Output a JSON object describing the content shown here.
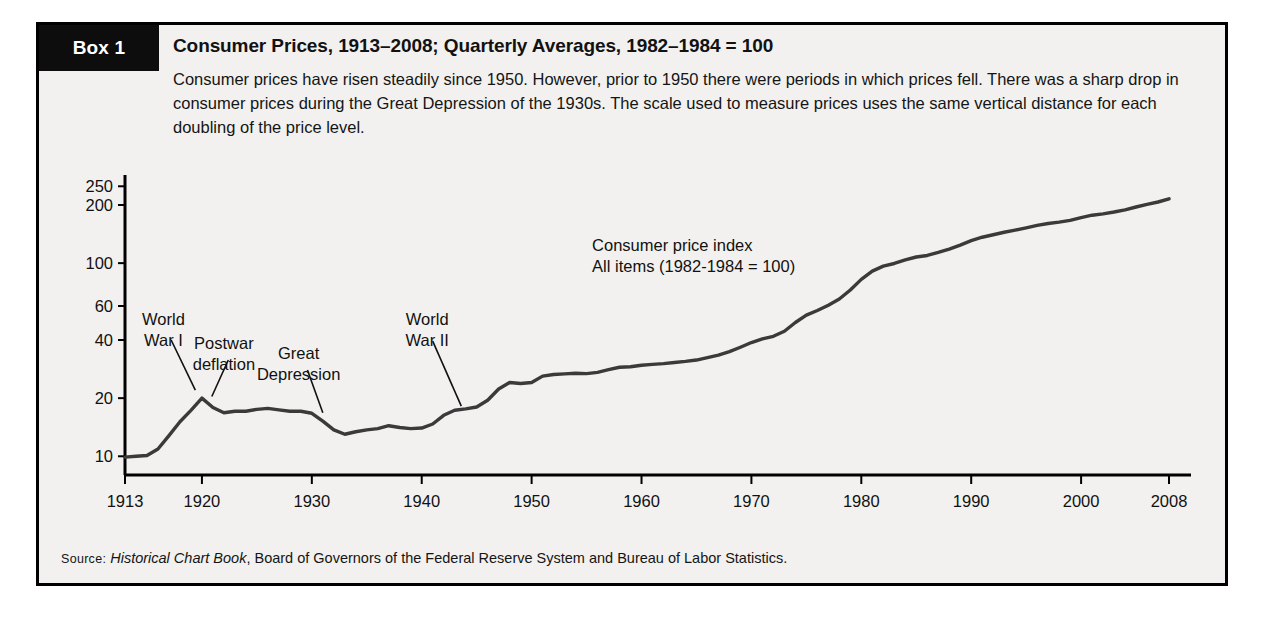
{
  "box": {
    "tag": "Box 1",
    "title": "Consumer Prices, 1913–2008; Quarterly Averages, 1982–1984 = 100",
    "intro": "Consumer prices have risen steadily since 1950. However, prior to 1950 there were periods in which prices fell. There was a sharp drop in consumer prices during the Great Depression of the 1930s. The scale used to measure prices uses the same vertical distance for each doubling of the price level.",
    "source_prefix": "Source:",
    "source_italic": "Historical Chart Book",
    "source_rest": ", Board of Governors of the Federal Reserve System and Bureau of Labor Statistics."
  },
  "colors": {
    "panel_background": "#f2f1ef",
    "frame": "#000000",
    "tag_background": "#0d0d0d",
    "tag_text": "#ffffff",
    "line": "#3a3a3a",
    "axis": "#000000",
    "text": "#111111"
  },
  "chart_data": {
    "type": "line",
    "title": "Consumer Prices, 1913–2008; Quarterly Averages, 1982–1984 = 100",
    "xlabel": "",
    "ylabel": "",
    "yscale": "log",
    "grid": false,
    "legend_position": "none",
    "xlim": [
      1913,
      2010
    ],
    "ylim": [
      8,
      260
    ],
    "ytick_values": [
      10,
      20,
      40,
      60,
      100,
      200,
      250
    ],
    "ytick_labels": [
      "10",
      "20",
      "40",
      "60",
      "100",
      "200",
      "250"
    ],
    "xtick_values": [
      1913,
      1920,
      1930,
      1940,
      1950,
      1960,
      1970,
      1980,
      1990,
      2000,
      2008
    ],
    "xtick_labels": [
      "1913",
      "1920",
      "1930",
      "1940",
      "1950",
      "1960",
      "1970",
      "1980",
      "1990",
      "2000",
      "2008"
    ],
    "series": [
      {
        "name": "Consumer price index, All items (1982-1984 = 100)",
        "x": [
          1913,
          1914,
          1915,
          1916,
          1917,
          1918,
          1919,
          1920,
          1921,
          1922,
          1923,
          1924,
          1925,
          1926,
          1927,
          1928,
          1929,
          1930,
          1931,
          1932,
          1933,
          1934,
          1935,
          1936,
          1937,
          1938,
          1939,
          1940,
          1941,
          1942,
          1943,
          1944,
          1945,
          1946,
          1947,
          1948,
          1949,
          1950,
          1951,
          1952,
          1953,
          1954,
          1955,
          1956,
          1957,
          1958,
          1959,
          1960,
          1961,
          1962,
          1963,
          1964,
          1965,
          1966,
          1967,
          1968,
          1969,
          1970,
          1971,
          1972,
          1973,
          1974,
          1975,
          1976,
          1977,
          1978,
          1979,
          1980,
          1981,
          1982,
          1983,
          1984,
          1985,
          1986,
          1987,
          1988,
          1989,
          1990,
          1991,
          1992,
          1993,
          1994,
          1995,
          1996,
          1997,
          1998,
          1999,
          2000,
          2001,
          2002,
          2003,
          2004,
          2005,
          2006,
          2007,
          2008
        ],
        "y": [
          9.9,
          10.0,
          10.1,
          10.9,
          12.8,
          15.1,
          17.3,
          20.0,
          17.9,
          16.8,
          17.1,
          17.1,
          17.5,
          17.7,
          17.4,
          17.1,
          17.1,
          16.7,
          15.2,
          13.7,
          13.0,
          13.4,
          13.7,
          13.9,
          14.4,
          14.1,
          13.9,
          14.0,
          14.7,
          16.3,
          17.3,
          17.6,
          18.0,
          19.5,
          22.3,
          24.1,
          23.8,
          24.1,
          26.0,
          26.5,
          26.7,
          26.9,
          26.8,
          27.2,
          28.1,
          28.9,
          29.1,
          29.6,
          29.9,
          30.2,
          30.6,
          31.0,
          31.5,
          32.4,
          33.4,
          34.8,
          36.7,
          38.8,
          40.5,
          41.8,
          44.4,
          49.3,
          53.8,
          56.9,
          60.6,
          65.2,
          72.6,
          82.4,
          90.9,
          96.5,
          99.6,
          103.9,
          107.6,
          109.6,
          113.6,
          118.3,
          124.0,
          130.7,
          136.2,
          140.3,
          144.5,
          148.2,
          152.4,
          156.9,
          160.5,
          163.0,
          166.6,
          172.2,
          177.1,
          179.9,
          184.0,
          188.9,
          195.3,
          201.6,
          207.3,
          215.3
        ]
      }
    ],
    "annotations": [
      {
        "id": "world-war-i",
        "text_lines": [
          "World",
          "War I"
        ],
        "x_year": 1916.5,
        "y_value": 48
      },
      {
        "id": "postwar-deflation",
        "text_lines": [
          "Postwar",
          "deflation"
        ],
        "x_year": 1922.0,
        "y_value": 36
      },
      {
        "id": "great-depression",
        "text_lines": [
          "Great",
          "Depression"
        ],
        "x_year": 1928.8,
        "y_value": 32
      },
      {
        "id": "world-war-ii",
        "text_lines": [
          "World",
          "War II"
        ],
        "x_year": 1940.5,
        "y_value": 48
      },
      {
        "id": "series-label",
        "text_lines": [
          "Consumer price index",
          "All items (1982-1984 = 100)"
        ],
        "x_year": 1955.5,
        "y_value": 115
      }
    ]
  }
}
